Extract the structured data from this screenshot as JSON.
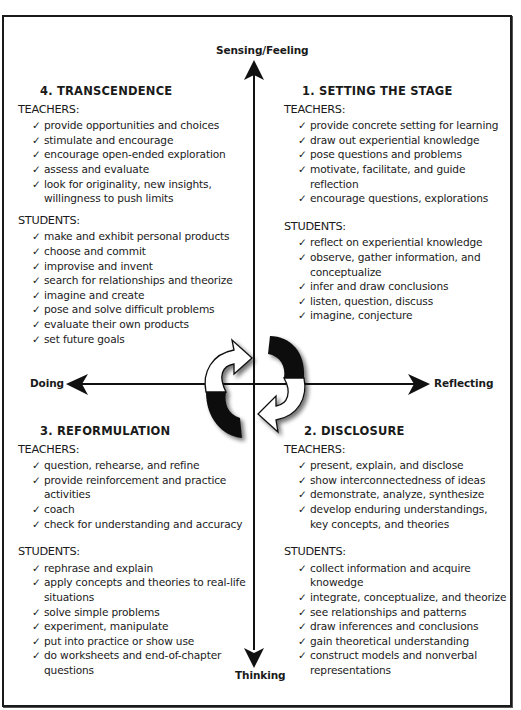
{
  "diagram": {
    "axes": {
      "top": "Sensing/Feeling",
      "bottom": "Thinking",
      "left": "Doing",
      "right": "Reflecting"
    },
    "check_glyph": "✓",
    "colors": {
      "ink": "#1a1a1a",
      "background": "#ffffff",
      "arrow_fill_dark": "#111111",
      "arrow_fill_light": "#ffffff"
    },
    "quadrants": {
      "top_left": {
        "title": "4. TRANSCENDENCE",
        "teachers_label": "TEACHERS:",
        "teachers": [
          "provide opportunities and choices",
          "stimulate and encourage",
          "encourage open-ended exploration",
          "assess and evaluate",
          "look for originality, new insights,\n  willingness to push limits"
        ],
        "students_label": "STUDENTS:",
        "students": [
          "make and exhibit personal products",
          "choose and commit",
          "improvise and invent",
          "search for relationships and theorize",
          "imagine and create",
          "pose and solve difficult problems",
          "evaluate their own products",
          "set future goals"
        ]
      },
      "top_right": {
        "title": "1. SETTING THE STAGE",
        "teachers_label": "TEACHERS:",
        "teachers": [
          "provide concrete setting for learning",
          "draw out experiential knowledge",
          "pose questions and problems",
          "motivate, facilitate, and guide reflection",
          "encourage questions, explorations"
        ],
        "students_label": "STUDENTS:",
        "students": [
          "reflect on experiential knowledge",
          "observe, gather information, and\n  conceptualize",
          "infer and draw conclusions",
          "listen, question, discuss",
          "imagine, conjecture"
        ]
      },
      "bottom_left": {
        "title": "3. REFORMULATION",
        "teachers_label": "TEACHERS:",
        "teachers": [
          "question, rehearse, and refine",
          "provide reinforcement and practice\n  activities",
          "coach",
          "check for understanding and accuracy"
        ],
        "students_label": "STUDENTS:",
        "students": [
          "rephrase and explain",
          "apply concepts and theories to real-life\n  situations",
          "solve simple problems",
          "experiment, manipulate",
          "put into practice or show use",
          "do worksheets and end-of-chapter\n  questions"
        ]
      },
      "bottom_right": {
        "title": "2. DISCLOSURE",
        "teachers_label": "TEACHERS:",
        "teachers": [
          "present, explain, and disclose",
          "show interconnectedness of ideas",
          "demonstrate, analyze, synthesize",
          "develop enduring understandings,\n  key concepts, and theories"
        ],
        "students_label": "STUDENTS:",
        "students": [
          "collect information and acquire\n  knowedge",
          "integrate, conceptualize, and theorize",
          "see relationships and patterns",
          "draw inferences and conclusions",
          "gain theoretical understanding",
          "construct models and nonverbal\n  representations"
        ]
      }
    }
  }
}
